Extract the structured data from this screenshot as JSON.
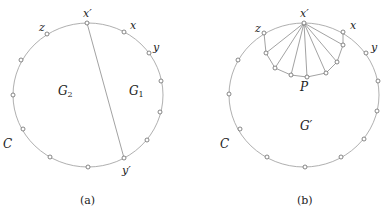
{
  "figure": {
    "panels": [
      {
        "id": "a",
        "caption": "(a)",
        "cycle_label": "C",
        "regions": [
          {
            "name": "G",
            "sub": "2"
          },
          {
            "name": "G",
            "sub": "1"
          }
        ],
        "vertex_labels": {
          "x_prime": "x′",
          "z": "z",
          "x": "x",
          "y": "y",
          "y_prime": "y′"
        },
        "chord": "x′–y′"
      },
      {
        "id": "b",
        "caption": "(b)",
        "cycle_label": "C",
        "region": "G′",
        "path_label": "P",
        "vertex_labels": {
          "x_prime": "x′",
          "z": "z",
          "x": "x",
          "y": "y"
        },
        "fan_center": "x′",
        "fan_size": 7
      }
    ]
  }
}
